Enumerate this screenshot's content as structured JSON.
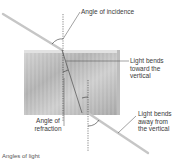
{
  "diagram": {
    "labels": {
      "angle_of_incidence": "Angle of incidence",
      "bends_toward_line1": "Light bends",
      "bends_toward_line2": "toward the",
      "bends_toward_line3": "vertical",
      "angle_of_refraction_line1": "Angle of",
      "angle_of_refraction_line2": "refraction",
      "bends_away_line1": "Light bends",
      "bends_away_line2": "away from",
      "bends_away_line3": "the vertical"
    },
    "caption": "Angles of light",
    "colors": {
      "ray": "#c8c8c8",
      "block_light": "#d6d6d6",
      "block_dark": "#a9a9a9",
      "dashed_line": "#333333",
      "leader_line": "#444444",
      "text": "#3a3a3a"
    }
  }
}
